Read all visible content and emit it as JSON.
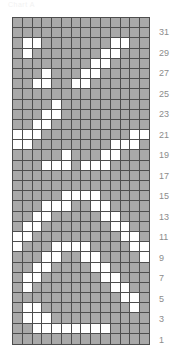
{
  "header": {
    "caption": "Chart A"
  },
  "chart_data": {
    "type": "heatmap",
    "title": "Chart A",
    "xlabel": "",
    "ylabel": "",
    "columns": 14,
    "rows": 32,
    "legend": [
      {
        "name": "filled",
        "color": "#a9a9a9"
      },
      {
        "name": "empty",
        "color": "#ffffff"
      }
    ],
    "grid": true,
    "gridline_color": "#4d4d4d",
    "row_label_position": "right",
    "row_labels": [
      31,
      29,
      27,
      25,
      23,
      21,
      19,
      17,
      15,
      13,
      11,
      9,
      7,
      5,
      3,
      1
    ],
    "row_label_rows_from_top": [
      1,
      3,
      5,
      7,
      9,
      11,
      13,
      15,
      17,
      19,
      21,
      23,
      25,
      27,
      29,
      31
    ],
    "values_note": "Rows listed top (row 32) to bottom (row 1). 1 = filled gray, 0 = empty white.",
    "values": [
      [
        1,
        1,
        1,
        1,
        1,
        1,
        1,
        1,
        1,
        1,
        1,
        1,
        1,
        1
      ],
      [
        1,
        1,
        1,
        1,
        1,
        1,
        1,
        1,
        1,
        1,
        1,
        1,
        1,
        1
      ],
      [
        1,
        0,
        0,
        1,
        1,
        1,
        1,
        1,
        1,
        1,
        0,
        0,
        1,
        1
      ],
      [
        1,
        0,
        1,
        1,
        1,
        1,
        1,
        1,
        1,
        0,
        0,
        1,
        1,
        1
      ],
      [
        1,
        1,
        1,
        1,
        1,
        1,
        1,
        1,
        0,
        0,
        1,
        1,
        1,
        1
      ],
      [
        1,
        1,
        1,
        0,
        1,
        1,
        1,
        0,
        0,
        1,
        1,
        1,
        1,
        1
      ],
      [
        1,
        1,
        0,
        0,
        1,
        1,
        0,
        0,
        1,
        1,
        1,
        1,
        1,
        1
      ],
      [
        1,
        1,
        1,
        1,
        1,
        1,
        1,
        1,
        1,
        1,
        1,
        1,
        1,
        1
      ],
      [
        1,
        1,
        1,
        1,
        0,
        1,
        1,
        1,
        1,
        1,
        1,
        1,
        1,
        1
      ],
      [
        1,
        1,
        1,
        0,
        0,
        1,
        1,
        1,
        1,
        1,
        1,
        1,
        1,
        1
      ],
      [
        1,
        1,
        0,
        0,
        1,
        1,
        1,
        1,
        1,
        1,
        1,
        1,
        1,
        1
      ],
      [
        0,
        0,
        0,
        1,
        1,
        1,
        1,
        1,
        1,
        1,
        1,
        1,
        0,
        0
      ],
      [
        0,
        0,
        1,
        1,
        1,
        1,
        1,
        1,
        1,
        1,
        0,
        0,
        0,
        1
      ],
      [
        1,
        1,
        1,
        1,
        1,
        0,
        1,
        1,
        1,
        0,
        0,
        1,
        1,
        1
      ],
      [
        1,
        1,
        1,
        0,
        0,
        0,
        1,
        0,
        0,
        0,
        1,
        1,
        1,
        1
      ],
      [
        1,
        1,
        1,
        1,
        1,
        1,
        1,
        1,
        1,
        1,
        1,
        1,
        1,
        1
      ],
      [
        1,
        1,
        1,
        1,
        1,
        1,
        1,
        1,
        1,
        1,
        1,
        1,
        1,
        1
      ],
      [
        1,
        1,
        1,
        1,
        1,
        0,
        0,
        0,
        0,
        1,
        1,
        1,
        1,
        1
      ],
      [
        1,
        1,
        1,
        0,
        0,
        0,
        1,
        1,
        0,
        0,
        1,
        1,
        1,
        1
      ],
      [
        1,
        1,
        0,
        0,
        1,
        1,
        1,
        1,
        1,
        0,
        0,
        1,
        1,
        1
      ],
      [
        1,
        0,
        0,
        1,
        1,
        1,
        1,
        1,
        1,
        1,
        0,
        0,
        1,
        1
      ],
      [
        0,
        0,
        1,
        1,
        1,
        1,
        1,
        1,
        1,
        1,
        1,
        0,
        0,
        1
      ],
      [
        0,
        1,
        1,
        1,
        0,
        0,
        0,
        0,
        1,
        1,
        1,
        1,
        0,
        0
      ],
      [
        1,
        1,
        1,
        0,
        0,
        1,
        1,
        0,
        0,
        1,
        1,
        1,
        1,
        0
      ],
      [
        1,
        1,
        0,
        0,
        1,
        1,
        1,
        1,
        0,
        0,
        1,
        1,
        1,
        1
      ],
      [
        1,
        0,
        0,
        1,
        1,
        1,
        1,
        1,
        1,
        0,
        0,
        1,
        1,
        1
      ],
      [
        1,
        0,
        1,
        1,
        1,
        1,
        1,
        1,
        1,
        1,
        0,
        0,
        1,
        1
      ],
      [
        1,
        1,
        1,
        1,
        1,
        1,
        1,
        1,
        1,
        1,
        1,
        0,
        0,
        1
      ],
      [
        1,
        0,
        0,
        1,
        1,
        1,
        1,
        1,
        1,
        1,
        1,
        1,
        0,
        1
      ],
      [
        1,
        0,
        0,
        0,
        1,
        1,
        1,
        1,
        1,
        1,
        1,
        1,
        1,
        1
      ],
      [
        1,
        1,
        0,
        0,
        0,
        0,
        0,
        0,
        0,
        0,
        1,
        1,
        1,
        1
      ],
      [
        1,
        1,
        1,
        1,
        1,
        1,
        1,
        1,
        1,
        1,
        1,
        1,
        1,
        1
      ]
    ]
  }
}
